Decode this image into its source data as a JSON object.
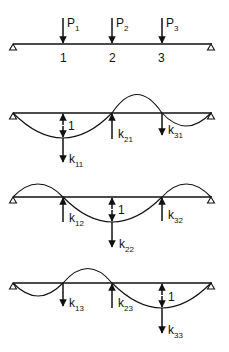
{
  "figure": {
    "colors": {
      "ink": "#111111",
      "background": "#ffffff"
    }
  },
  "loaded_beam": {
    "loads": [
      {
        "symbol": "P",
        "subscript": "1"
      },
      {
        "symbol": "P",
        "subscript": "2"
      },
      {
        "symbol": "P",
        "subscript": "3"
      }
    ],
    "node_labels": [
      "1",
      "2",
      "3"
    ]
  },
  "deflection_cases": [
    {
      "unit_label": "1",
      "coefficients": [
        {
          "symbol": "k",
          "subscript": "11",
          "direction": "down"
        },
        {
          "symbol": "k",
          "subscript": "21",
          "direction": "up"
        },
        {
          "symbol": "k",
          "subscript": "31",
          "direction": "down"
        }
      ]
    },
    {
      "unit_label": "1",
      "coefficients": [
        {
          "symbol": "k",
          "subscript": "12",
          "direction": "up"
        },
        {
          "symbol": "k",
          "subscript": "22",
          "direction": "down"
        },
        {
          "symbol": "k",
          "subscript": "32",
          "direction": "up"
        }
      ]
    },
    {
      "unit_label": "1",
      "coefficients": [
        {
          "symbol": "k",
          "subscript": "13",
          "direction": "down"
        },
        {
          "symbol": "k",
          "subscript": "23",
          "direction": "up"
        },
        {
          "symbol": "k",
          "subscript": "33",
          "direction": "down"
        }
      ]
    }
  ]
}
